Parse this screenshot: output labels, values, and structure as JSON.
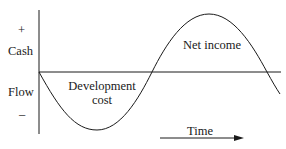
{
  "diagram": {
    "type": "cash-flow-curve",
    "y_axis": {
      "label_top": "Cash",
      "label_bottom": "Flow",
      "plus": "+",
      "minus": "–"
    },
    "x_axis": {
      "label": "Time"
    },
    "regions": [
      {
        "name": "negative",
        "label_line1": "Development",
        "label_line2": "cost"
      },
      {
        "name": "positive",
        "label": "Net income"
      }
    ],
    "colors": {
      "stroke": "#1a1a1a",
      "background": "#ffffff"
    }
  }
}
